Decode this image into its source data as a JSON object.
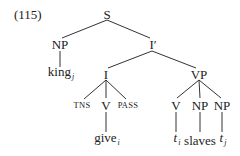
{
  "example_number": "(115)",
  "tree": {
    "root": "S",
    "subject": {
      "label": "NP",
      "leaf": "king",
      "leaf_index": "j"
    },
    "i_bar": {
      "label": "I′"
    },
    "infl": {
      "label": "I",
      "children": [
        {
          "label": "TNS"
        },
        {
          "label": "V",
          "leaf": "give",
          "leaf_index": "i"
        },
        {
          "label": "PASS"
        }
      ]
    },
    "vp": {
      "label": "VP",
      "children": [
        {
          "label": "V",
          "leaf": "t",
          "leaf_index": "i"
        },
        {
          "label": "NP",
          "leaf": "slaves"
        },
        {
          "label": "NP",
          "leaf": "t",
          "leaf_index": "j"
        }
      ]
    }
  }
}
